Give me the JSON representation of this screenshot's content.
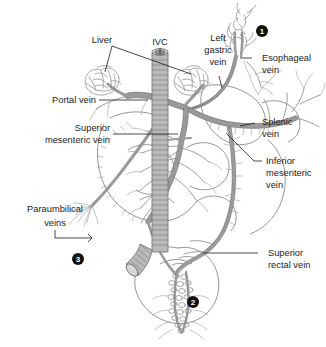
{
  "figure": {
    "background_color": "#ffffff",
    "vessel_color": "#9a9a9a",
    "outline_color": "#6f6f6f",
    "label_color": "#232323",
    "marker_color": "#111111"
  },
  "labels": {
    "liver": "Liver",
    "ivc": "IVC",
    "left_gastric_vein_l1": "Left",
    "left_gastric_vein_l2": "gastric",
    "left_gastric_vein_l3": "vein",
    "esophageal_vein_l1": "Esophageal",
    "esophageal_vein_l2": "vein",
    "portal_vein": "Portal vein",
    "splenic_vein_l1": "Splenic",
    "splenic_vein_l2": "vein",
    "superior_mesenteric_vein_l1": "Superior",
    "superior_mesenteric_vein_l2": "mesenteric vein",
    "inferior_mesenteric_vein_l1": "Inferior",
    "inferior_mesenteric_vein_l2": "mesenteric",
    "inferior_mesenteric_vein_l3": "vein",
    "paraumbilical_veins_l1": "Paraumbilical",
    "paraumbilical_veins_l2": "veins",
    "superior_rectal_vein_l1": "Superior",
    "superior_rectal_vein_l2": "rectal vein"
  },
  "markers": [
    {
      "id": "marker-1",
      "number": "1",
      "glyph": "❶",
      "region": "esophageal-varices",
      "x": 262,
      "y": 31
    },
    {
      "id": "marker-2",
      "number": "2",
      "glyph": "❷",
      "region": "hemorrhoidal-plexus",
      "x": 193,
      "y": 302
    },
    {
      "id": "marker-3",
      "number": "3",
      "glyph": "❸",
      "region": "caput-medusae",
      "x": 78,
      "y": 259
    }
  ],
  "structures": [
    "liver-left-lobe",
    "liver-right-lobe",
    "inferior-vena-cava",
    "left-gastric-vein",
    "esophageal-vein",
    "portal-vein",
    "splenic-vein",
    "superior-mesenteric-vein",
    "inferior-mesenteric-vein",
    "paraumbilical-veins",
    "superior-rectal-vein",
    "stomach",
    "small-bowel-loops",
    "colon",
    "rectum",
    "hemorrhoidal-plexus"
  ]
}
